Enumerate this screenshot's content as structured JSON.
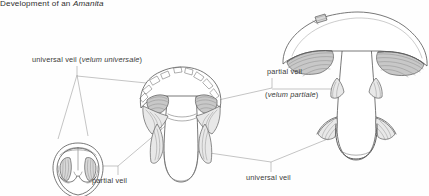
{
  "figure": {
    "title_prefix": "Development of an ",
    "title_taxon": "Amanita",
    "background_color": "#fefefe",
    "ink_color": "#4a4a4a",
    "text_color": "#3a3a3a"
  },
  "labels": {
    "universal_veil_top": {
      "text": "universal veil (",
      "latin": "velum universale",
      "close": ")"
    },
    "partial_veil_right": {
      "text": "partial veil"
    },
    "partial_veil_right_latin": {
      "open": "(",
      "latin": "velum partiale",
      "close": ")"
    },
    "partial_veil_bottom": {
      "text": "partial veil"
    },
    "universal_veil_bottom": {
      "text": "universal veil"
    }
  },
  "stages": [
    {
      "name": "egg-stage",
      "description": "button stage enclosed in universal veil"
    },
    {
      "name": "expanding-stage",
      "description": "cap expanding, universal veil ruptured, partial veil stretched"
    },
    {
      "name": "mature-stage",
      "description": "mature fruiting body with volva, ring and gills"
    }
  ]
}
